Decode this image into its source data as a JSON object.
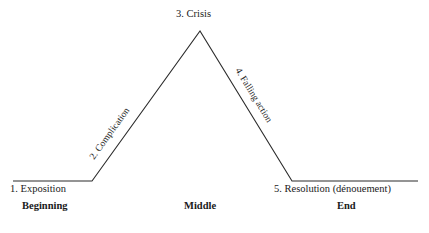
{
  "diagram": {
    "line_color": "#2b2b2b",
    "background_color": "#ffffff",
    "stages": {
      "exposition": "1. Exposition",
      "complication": "2. Complication",
      "crisis": "3. Crisis",
      "falling_action": "4. Falling action",
      "resolution": "5. Resolution (dénouement)"
    },
    "sections": {
      "beginning": "Beginning",
      "middle": "Middle",
      "end": "End"
    }
  },
  "chart_data": {
    "type": "line",
    "xlabel": "",
    "ylabel": "",
    "x": [
      13,
      92,
      200,
      292,
      418
    ],
    "y": [
      181,
      181,
      31,
      181,
      181
    ],
    "point_labels": [
      "1. Exposition",
      "2. Complication",
      "3. Crisis",
      "4. Falling action",
      "5. Resolution (dénouement)"
    ],
    "segments": [
      {
        "name": "1. Exposition",
        "from": [
          13,
          181
        ],
        "to": [
          92,
          181
        ],
        "shape": "flat"
      },
      {
        "name": "2. Complication",
        "from": [
          92,
          181
        ],
        "to": [
          200,
          31
        ],
        "shape": "rising"
      },
      {
        "name": "4. Falling action",
        "from": [
          200,
          31
        ],
        "to": [
          292,
          181
        ],
        "shape": "falling"
      },
      {
        "name": "5. Resolution (dénouement)",
        "from": [
          292,
          181
        ],
        "to": [
          418,
          181
        ],
        "shape": "flat"
      }
    ],
    "annotations": [
      "Beginning",
      "Middle",
      "End"
    ],
    "grid": false,
    "legend": "none"
  }
}
